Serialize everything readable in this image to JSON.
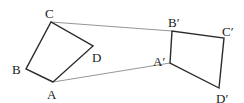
{
  "diagram": {
    "type": "geometric-translation",
    "colors": {
      "shape_stroke": "#2b2b2b",
      "connector_stroke": "#8a8a8a",
      "label": "#222222"
    },
    "original": {
      "vertices": [
        {
          "name": "A",
          "x": 53,
          "y": 82
        },
        {
          "name": "B",
          "x": 26,
          "y": 69
        },
        {
          "name": "C",
          "x": 51,
          "y": 22
        },
        {
          "name": "D",
          "x": 93,
          "y": 46
        }
      ],
      "labels": [
        {
          "text": "A",
          "x": 47,
          "y": 99
        },
        {
          "text": "B",
          "x": 12,
          "y": 74
        },
        {
          "text": "C",
          "x": 45,
          "y": 18
        },
        {
          "text": "D",
          "x": 92,
          "y": 62
        }
      ]
    },
    "image": {
      "vertices": [
        {
          "name": "A'",
          "x": 170,
          "y": 63
        },
        {
          "name": "B'",
          "x": 172,
          "y": 31
        },
        {
          "name": "C'",
          "x": 224,
          "y": 38
        },
        {
          "name": "D'",
          "x": 219,
          "y": 88
        }
      ],
      "labels": [
        {
          "text": "A′",
          "x": 153,
          "y": 66
        },
        {
          "text": "B′",
          "x": 168,
          "y": 27
        },
        {
          "text": "C′",
          "x": 222,
          "y": 36
        },
        {
          "text": "D′",
          "x": 216,
          "y": 103
        }
      ]
    },
    "connectors": [
      {
        "from": "C",
        "to": "B'",
        "x1": 51,
        "y1": 22,
        "x2": 172,
        "y2": 31
      },
      {
        "from": "A",
        "to": "A'",
        "x1": 53,
        "y1": 82,
        "x2": 170,
        "y2": 63
      }
    ]
  }
}
